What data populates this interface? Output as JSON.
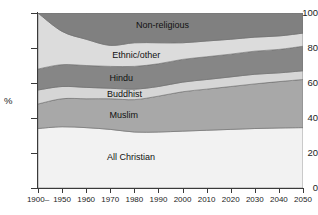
{
  "chart_data": {
    "type": "area",
    "stacked": true,
    "title": "",
    "subtitle": "",
    "xlabel": "",
    "ylabel": "%",
    "ylim": [
      0,
      100
    ],
    "yticks": [
      0,
      20,
      40,
      60,
      80,
      100
    ],
    "grid": false,
    "legend_position": "inline-labels",
    "x": [
      "1900–",
      "1950",
      "1960",
      "1970",
      "1980",
      "1990",
      "2000",
      "2010",
      "2020",
      "2030",
      "2040",
      "2050"
    ],
    "xtick_labels": [
      "1900–",
      "1950",
      "1960",
      "1970",
      "1980",
      "1990",
      "2000",
      "2010",
      "2020",
      "2030",
      "2040",
      "2050"
    ],
    "series": [
      {
        "name": "All Christian",
        "color": "#f2f2f2",
        "values": [
          34.0,
          35.0,
          34.5,
          33.5,
          32.0,
          32.0,
          32.5,
          33.0,
          33.5,
          34.0,
          34.3,
          34.5
        ]
      },
      {
        "name": "Muslim",
        "color": "#a8a8a8",
        "values": [
          14.0,
          16.0,
          16.5,
          17.5,
          18.5,
          20.5,
          22.5,
          23.5,
          24.5,
          25.5,
          26.5,
          27.5
        ]
      },
      {
        "name": "Buddhist",
        "color": "#d6d6d6",
        "values": [
          8.0,
          7.0,
          6.5,
          6.0,
          6.0,
          5.5,
          5.5,
          5.5,
          5.5,
          5.5,
          5.0,
          5.0
        ]
      },
      {
        "name": "Hindu",
        "color": "#868686",
        "values": [
          12.0,
          12.5,
          12.5,
          12.5,
          13.0,
          13.0,
          13.0,
          13.0,
          13.0,
          13.2,
          13.4,
          14.0
        ]
      },
      {
        "name": "Ethnic/other",
        "color": "#dcdcdc",
        "values": [
          32.0,
          19.0,
          15.0,
          12.0,
          13.5,
          12.0,
          9.5,
          9.0,
          8.5,
          8.0,
          7.7,
          7.5
        ]
      },
      {
        "name": "Non-religious",
        "color": "#808080",
        "values": [
          0.0,
          10.5,
          15.0,
          18.5,
          17.0,
          17.0,
          17.0,
          16.0,
          15.0,
          13.8,
          13.1,
          11.5
        ]
      }
    ],
    "cumulative_tops": {
      "All Christian": [
        34.0,
        35.0,
        34.5,
        33.5,
        32.0,
        32.0,
        32.5,
        33.0,
        33.5,
        34.0,
        34.3,
        34.5
      ],
      "Muslim": [
        48.0,
        51.0,
        51.0,
        51.0,
        50.5,
        52.5,
        55.0,
        56.5,
        58.0,
        59.5,
        60.8,
        62.0
      ],
      "Buddhist": [
        56.0,
        58.0,
        57.5,
        57.0,
        56.5,
        58.0,
        60.5,
        62.0,
        63.5,
        65.0,
        65.8,
        67.0
      ],
      "Hindu": [
        68.0,
        70.5,
        70.0,
        69.5,
        69.5,
        71.0,
        73.5,
        75.0,
        76.5,
        78.2,
        79.2,
        81.0
      ],
      "Ethnic/other": [
        100.0,
        89.5,
        85.0,
        81.5,
        83.0,
        83.0,
        83.0,
        84.0,
        85.0,
        86.2,
        86.9,
        88.5
      ],
      "Non-religious": [
        100.0,
        100.0,
        100.0,
        100.0,
        100.0,
        100.0,
        100.0,
        100.0,
        100.0,
        100.0,
        100.0,
        100.0
      ]
    },
    "band_labels": [
      {
        "text": "Non-religious",
        "x_pct": 37,
        "y_pct": 93
      },
      {
        "text": "Ethnic/other",
        "x_pct": 28,
        "y_pct": 76
      },
      {
        "text": "Hindu",
        "x_pct": 27,
        "y_pct": 63
      },
      {
        "text": "Buddhist",
        "x_pct": 26,
        "y_pct": 54
      },
      {
        "text": "Muslim",
        "x_pct": 27,
        "y_pct": 42
      },
      {
        "text": "All Christian",
        "x_pct": 26,
        "y_pct": 18
      }
    ]
  },
  "axis": {
    "y_title": "%",
    "y_labels": [
      "100",
      "80",
      "60",
      "40",
      "20",
      "0"
    ],
    "x_labels": [
      "1900–",
      "1950",
      "1960",
      "1970",
      "1980",
      "1990",
      "2000",
      "2010",
      "2020",
      "2030",
      "2040",
      "2050"
    ]
  }
}
